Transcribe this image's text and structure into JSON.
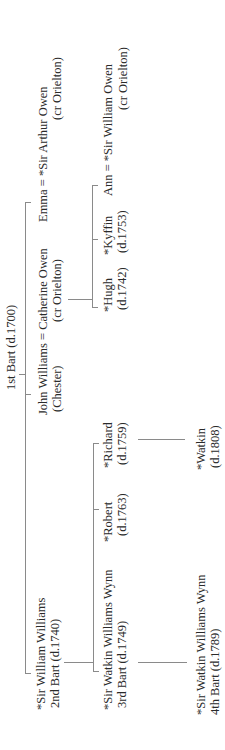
{
  "diagram": {
    "type": "family-tree",
    "orientation": "rotated-90-ccw",
    "root": {
      "line1": "1st Bart (d.1700)"
    },
    "generation1": {
      "sir_william": {
        "line1": "*Sir William Williams",
        "line2": "2nd Bart (d.1740)"
      },
      "john": {
        "line1": "John Williams = Catherine Owen",
        "line2a": "(Chester)",
        "line2b": "(cr Orielton)"
      },
      "emma": {
        "line1": "Emma = *Sir Arthur Owen",
        "line2": "(cr Orielton)"
      }
    },
    "generation2": {
      "sir_watkin_3": {
        "line1": "*Sir Watkin Williams Wynn",
        "line2": "3rd Bart (d.1749)"
      },
      "robert": {
        "line1": "*Robert",
        "line2": "(d.1763)"
      },
      "richard": {
        "line1": "*Richard",
        "line2": "(d.1759)"
      },
      "hugh": {
        "line1": "*Hugh",
        "line2": "(d.1742)"
      },
      "kyffin": {
        "line1": "*Kyffin",
        "line2": "(d.1753)"
      },
      "ann": {
        "line1": "Ann = *Sir William Owen",
        "line2": "(cr Orielton)"
      }
    },
    "generation3": {
      "sir_watkin_4": {
        "line1": "*Sir Watkin Williams Wynn",
        "line2": "4th Bart (d.1789)"
      },
      "watkin": {
        "line1": "*Watkin",
        "line2": "(d.1808)"
      }
    },
    "colors": {
      "line": "#8a8a8a",
      "text": "#2a2a2a",
      "background": "#ffffff"
    }
  }
}
